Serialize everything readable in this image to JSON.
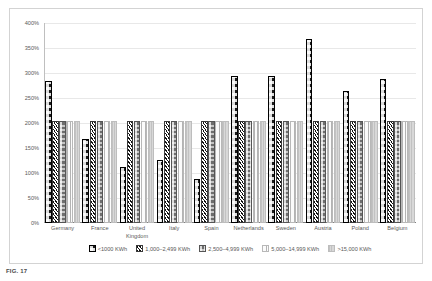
{
  "caption": "FIG. 17",
  "chart_data": {
    "type": "bar",
    "title": "",
    "subtitle": "",
    "xlabel": "",
    "ylabel": "",
    "ylim": [
      0,
      400
    ],
    "ytick_step": 50,
    "ytick_labels": [
      "400%",
      "350%",
      "300%",
      "250%",
      "200%",
      "150%",
      "100%",
      "50%",
      "0%"
    ],
    "ytick_values": [
      400,
      350,
      300,
      250,
      200,
      150,
      100,
      50,
      0
    ],
    "grid": true,
    "legend_position": "bottom",
    "categories": [
      "Germany",
      "France",
      "United Kingdom",
      "Italy",
      "Spain",
      "Netherlands",
      "Sweden",
      "Austria",
      "Poland",
      "Belgium"
    ],
    "series": [
      {
        "name": "<1000 KWh",
        "pattern": "dense-checker-black",
        "values": [
          280,
          165,
          108,
          122,
          85,
          290,
          290,
          365,
          260,
          285
        ]
      },
      {
        "name": "1,000–2,499 KWh",
        "pattern": "diagonal-hatch",
        "values": [
          200,
          200,
          200,
          200,
          200,
          200,
          200,
          200,
          200,
          200
        ]
      },
      {
        "name": "2,500–4,999 KWh",
        "pattern": "gray-checker",
        "values": [
          200,
          200,
          200,
          200,
          200,
          200,
          200,
          200,
          200,
          200
        ]
      },
      {
        "name": "5,000–14,999 KWh",
        "pattern": "vertical-thin-lines",
        "values": [
          200,
          200,
          200,
          200,
          200,
          200,
          200,
          200,
          200,
          200
        ]
      },
      {
        "name": ">15,000 KWh",
        "pattern": "light-gray-solid",
        "values": [
          200,
          200,
          200,
          200,
          200,
          200,
          200,
          200,
          200,
          200
        ]
      }
    ]
  }
}
